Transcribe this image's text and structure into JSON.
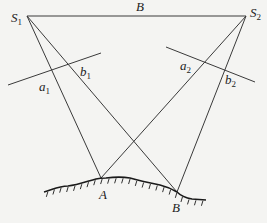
{
  "diagram": {
    "labels": {
      "s1": {
        "main": "S",
        "sub": "1"
      },
      "s2": {
        "main": "S",
        "sub": "2"
      },
      "baseline": "B",
      "a1": {
        "main": "a",
        "sub": "1"
      },
      "b1": {
        "main": "b",
        "sub": "1"
      },
      "a2": {
        "main": "a",
        "sub": "2"
      },
      "b2": {
        "main": "b",
        "sub": "2"
      },
      "ground_a": "A",
      "ground_b": "B"
    },
    "colors": {
      "line": "#3a3a3a",
      "ground": "#1a1a1a",
      "background": "#f4f4f2"
    }
  }
}
